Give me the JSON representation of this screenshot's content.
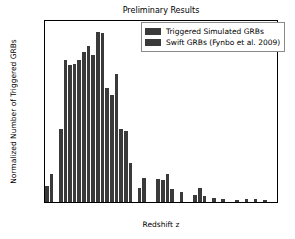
{
  "chart_data": {
    "type": "bar",
    "title": "Preliminary Results",
    "xlabel": "Redshift z",
    "ylabel": "Normalized Number of Triggered GRBs",
    "xlim": [
      0,
      10
    ],
    "ylim": [
      0,
      0.18
    ],
    "grid": false,
    "bin_width": 0.2,
    "bar_color": "#3a3a3a",
    "xticks": [
      "0",
      "2",
      "4",
      "6",
      "8",
      "10"
    ],
    "xtick_values": [
      0,
      2,
      4,
      6,
      8,
      10
    ],
    "yticks": [
      "0.00",
      "0.02",
      "0.04",
      "0.06",
      "0.08",
      "0.10",
      "0.12",
      "0.14",
      "0.16",
      "0.18"
    ],
    "ytick_values": [
      0.0,
      0.02,
      0.04,
      0.06,
      0.08,
      0.1,
      0.12,
      0.14,
      0.16,
      0.18
    ],
    "legend_position": "top-right",
    "legend": [
      {
        "label": "Triggered Simulated GRBs",
        "color": "#3a3a3a"
      },
      {
        "label": "Swift GRBs (Fynbo et al. 2009)",
        "color": "#3a3a3a"
      }
    ],
    "x": [
      0.1,
      0.3,
      0.5,
      0.7,
      0.9,
      1.1,
      1.3,
      1.5,
      1.7,
      1.9,
      2.1,
      2.3,
      2.5,
      2.7,
      2.9,
      3.1,
      3.3,
      3.5,
      3.7,
      3.9,
      4.1,
      4.3,
      4.5,
      4.7,
      4.9,
      5.1,
      5.3,
      5.5,
      5.7,
      5.9,
      6.1,
      6.3,
      6.5,
      6.7,
      6.9,
      7.1,
      7.3,
      7.5,
      7.7,
      7.9,
      8.1,
      8.3,
      8.5,
      8.7,
      8.9,
      9.1,
      9.3,
      9.5,
      9.7
    ],
    "values": [
      0.016,
      0.028,
      0.0,
      0.073,
      0.141,
      0.136,
      0.137,
      0.141,
      0.149,
      0.155,
      0.146,
      0.169,
      0.168,
      0.113,
      0.106,
      0.127,
      0.073,
      0.071,
      0.039,
      0.0,
      0.014,
      0.024,
      0.0,
      0.0,
      0.023,
      0.022,
      0.028,
      0.013,
      0.0,
      0.01,
      0.0,
      0.0,
      0.007,
      0.014,
      0.006,
      0.0,
      0.004,
      0.0,
      0.003,
      0.0,
      0.0,
      0.002,
      0.0,
      0.003,
      0.0,
      0.003,
      0.0,
      0.002,
      0.0
    ]
  }
}
